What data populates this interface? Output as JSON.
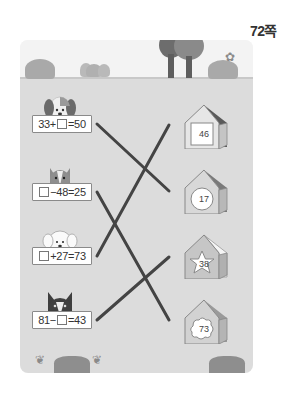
{
  "page": {
    "number_label": "72쪽"
  },
  "left_items": [
    {
      "animal": "spotted-dog",
      "equation_parts": [
        "33+",
        "box",
        "=50"
      ],
      "equation_text": "33+□=50"
    },
    {
      "animal": "cat",
      "equation_parts": [
        "box",
        "−48=25"
      ],
      "equation_text": "□−48=25"
    },
    {
      "animal": "white-puppy",
      "equation_parts": [
        "box",
        "+27=73"
      ],
      "equation_text": "□+27=73"
    },
    {
      "animal": "black-cat",
      "equation_parts": [
        "81−",
        "box",
        "=43"
      ],
      "equation_text": "81−□=43"
    }
  ],
  "right_items": [
    {
      "shape": "square",
      "value": "46"
    },
    {
      "shape": "circle",
      "value": "17"
    },
    {
      "shape": "star",
      "value": "38"
    },
    {
      "shape": "cloud",
      "value": "73"
    }
  ],
  "connections": [
    {
      "from": 0,
      "to": 1
    },
    {
      "from": 1,
      "to": 3
    },
    {
      "from": 2,
      "to": 0
    },
    {
      "from": 3,
      "to": 2
    }
  ],
  "colors": {
    "line": "#444444",
    "ground": "#dcdcdc",
    "sky": "#f3f3f3",
    "roof": "#5a5a5a"
  }
}
